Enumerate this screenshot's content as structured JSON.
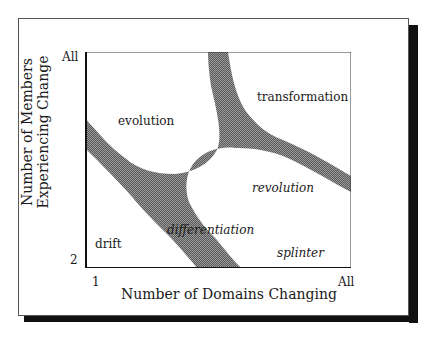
{
  "figure": {
    "frame_color": "#555555",
    "shadow_color": "#111111",
    "shade_color": "#7a7a7a",
    "x_axis": {
      "label": "Number of Domains Changing",
      "min_tick": "1",
      "max_tick": "All"
    },
    "y_axis": {
      "label_line1": "Number of Members",
      "label_line2": "Experiencing Change",
      "min_tick": "2",
      "max_tick": "All"
    },
    "regions": [
      {
        "name": "evolution",
        "style": "normal"
      },
      {
        "name": "transformation",
        "style": "normal"
      },
      {
        "name": "revolution",
        "style": "italic"
      },
      {
        "name": "differentiation",
        "style": "italic"
      },
      {
        "name": "drift",
        "style": "normal"
      },
      {
        "name": "splinter",
        "style": "italic"
      }
    ]
  }
}
